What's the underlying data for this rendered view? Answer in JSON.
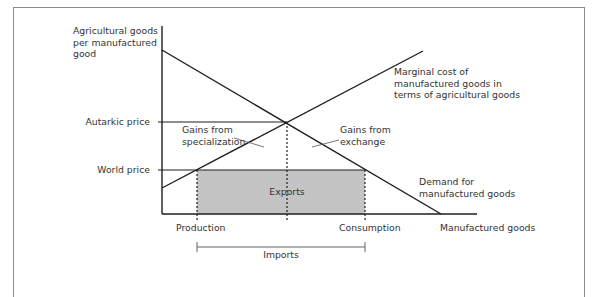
{
  "diagram": {
    "y_axis_label": [
      "Agricultural goods",
      "per manufactured",
      "good"
    ],
    "x_axis_label": "Manufactured goods",
    "price_ticks": [
      {
        "label": "Autarkic price",
        "y": 122
      },
      {
        "label": "World price",
        "y": 170
      }
    ],
    "curves": {
      "supply": {
        "label": [
          "Marginal cost of",
          "manufactured goods in",
          "terms of agricultural goods"
        ]
      },
      "demand": {
        "label": [
          "Demand for",
          "manufactured goods"
        ]
      }
    },
    "annotations": {
      "gains_specialization": [
        "Gains from",
        "specialization"
      ],
      "gains_exchange": [
        "Gains from",
        "exchange"
      ],
      "exports": "Exports"
    },
    "quantity_labels": {
      "production": "Production",
      "consumption": "Consumption",
      "imports": "Imports"
    },
    "colors": {
      "line": "#1e1e1e",
      "shaded_area": "#c4c4c4",
      "frame": "#8a8a8a"
    }
  }
}
